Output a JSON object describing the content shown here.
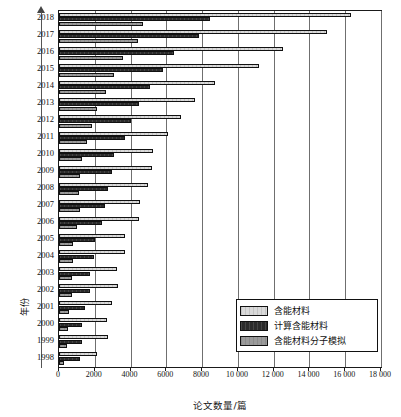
{
  "chart_data": {
    "type": "bar",
    "orientation": "horizontal",
    "title": "",
    "xlabel": "论文数量/篇",
    "ylabel": "年份",
    "xlim": [
      0,
      18000
    ],
    "xticks": [
      0,
      2000,
      4000,
      6000,
      8000,
      10000,
      12000,
      14000,
      16000,
      18000
    ],
    "xtick_labels": [
      "0",
      "2000",
      "4000",
      "6000",
      "8000",
      "10 000",
      "12 000",
      "14 000",
      "16 000",
      "18 000"
    ],
    "grid": "vertical",
    "legend_position": "inside-lower-right",
    "categories": [
      "2018",
      "2017",
      "2016",
      "2015",
      "2014",
      "2013",
      "2012",
      "2011",
      "2010",
      "2009",
      "2008",
      "2007",
      "2006",
      "2005",
      "2004",
      "2003",
      "2002",
      "2001",
      "2000",
      "1999",
      "1998"
    ],
    "series": [
      {
        "name": "含能材料",
        "color": "#d9d9d9",
        "values": [
          16300,
          15000,
          12500,
          11200,
          8700,
          7600,
          6800,
          6100,
          5250,
          5200,
          4950,
          4500,
          4450,
          3700,
          3700,
          3250,
          3300,
          2950,
          2700,
          2750,
          2150
        ]
      },
      {
        "name": "计算含能材料",
        "color": "#2b2b2b",
        "values": [
          8450,
          7800,
          6450,
          5800,
          5100,
          4450,
          4000,
          3700,
          3100,
          2950,
          2750,
          2550,
          2400,
          2000,
          1950,
          1750,
          1750,
          1450,
          1300,
          1300,
          1150
        ]
      },
      {
        "name": "含能材料分子模拟",
        "color": "#9a9a9a",
        "values": [
          4700,
          4400,
          3550,
          3050,
          2600,
          2100,
          1850,
          1550,
          1300,
          1200,
          1100,
          1150,
          1000,
          800,
          800,
          700,
          700,
          550,
          500,
          450,
          300
        ]
      }
    ],
    "legend": [
      {
        "label": "含能材料",
        "swatch": "#d9d9d9"
      },
      {
        "label": "计算含能材料",
        "swatch": "#2b2b2b"
      },
      {
        "label": "含能材料分子模拟",
        "swatch": "#9a9a9a"
      }
    ]
  }
}
